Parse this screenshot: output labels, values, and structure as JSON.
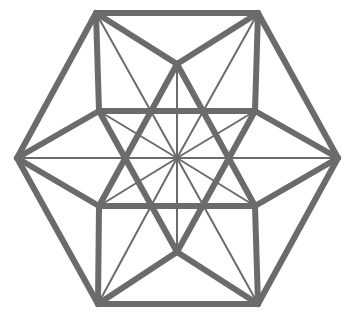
{
  "diagram": {
    "stroke_color": "#6b6b6b",
    "background": "#ffffff",
    "vertices": {
      "TL": [
        96,
        13
      ],
      "TR": [
        258,
        13
      ],
      "L": [
        17,
        158
      ],
      "R": [
        338,
        158
      ],
      "BL": [
        98,
        304
      ],
      "BR": [
        258,
        304
      ],
      "TOP": [
        177,
        64
      ],
      "BOT": [
        177,
        252
      ],
      "UL": [
        99,
        111
      ],
      "UR": [
        255,
        111
      ],
      "LL": [
        99,
        206
      ],
      "LR": [
        255,
        206
      ],
      "C": [
        177,
        158
      ]
    },
    "thick_edges": [
      [
        "TL",
        "TR"
      ],
      [
        "TR",
        "R"
      ],
      [
        "R",
        "BR"
      ],
      [
        "BR",
        "BL"
      ],
      [
        "BL",
        "L"
      ],
      [
        "L",
        "TL"
      ],
      [
        "TL",
        "UL"
      ],
      [
        "TR",
        "UR"
      ],
      [
        "BL",
        "LL"
      ],
      [
        "BR",
        "LR"
      ],
      [
        "UL",
        "UR"
      ],
      [
        "LL",
        "LR"
      ],
      [
        "TL",
        "TOP"
      ],
      [
        "TR",
        "TOP"
      ],
      [
        "BL",
        "BOT"
      ],
      [
        "BR",
        "BOT"
      ],
      [
        "L",
        "UL"
      ],
      [
        "L",
        "LL"
      ],
      [
        "R",
        "UR"
      ],
      [
        "R",
        "LR"
      ],
      [
        "TOP",
        "LL"
      ],
      [
        "TOP",
        "LR"
      ],
      [
        "BOT",
        "UL"
      ],
      [
        "BOT",
        "UR"
      ]
    ],
    "thin_edges": [
      [
        "TOP",
        "BOT"
      ],
      [
        "L",
        "R"
      ],
      [
        "C",
        "TL"
      ],
      [
        "C",
        "TR"
      ],
      [
        "C",
        "BL"
      ],
      [
        "C",
        "BR"
      ],
      [
        "C",
        "UL"
      ],
      [
        "C",
        "UR"
      ],
      [
        "C",
        "LL"
      ],
      [
        "C",
        "LR"
      ]
    ]
  }
}
